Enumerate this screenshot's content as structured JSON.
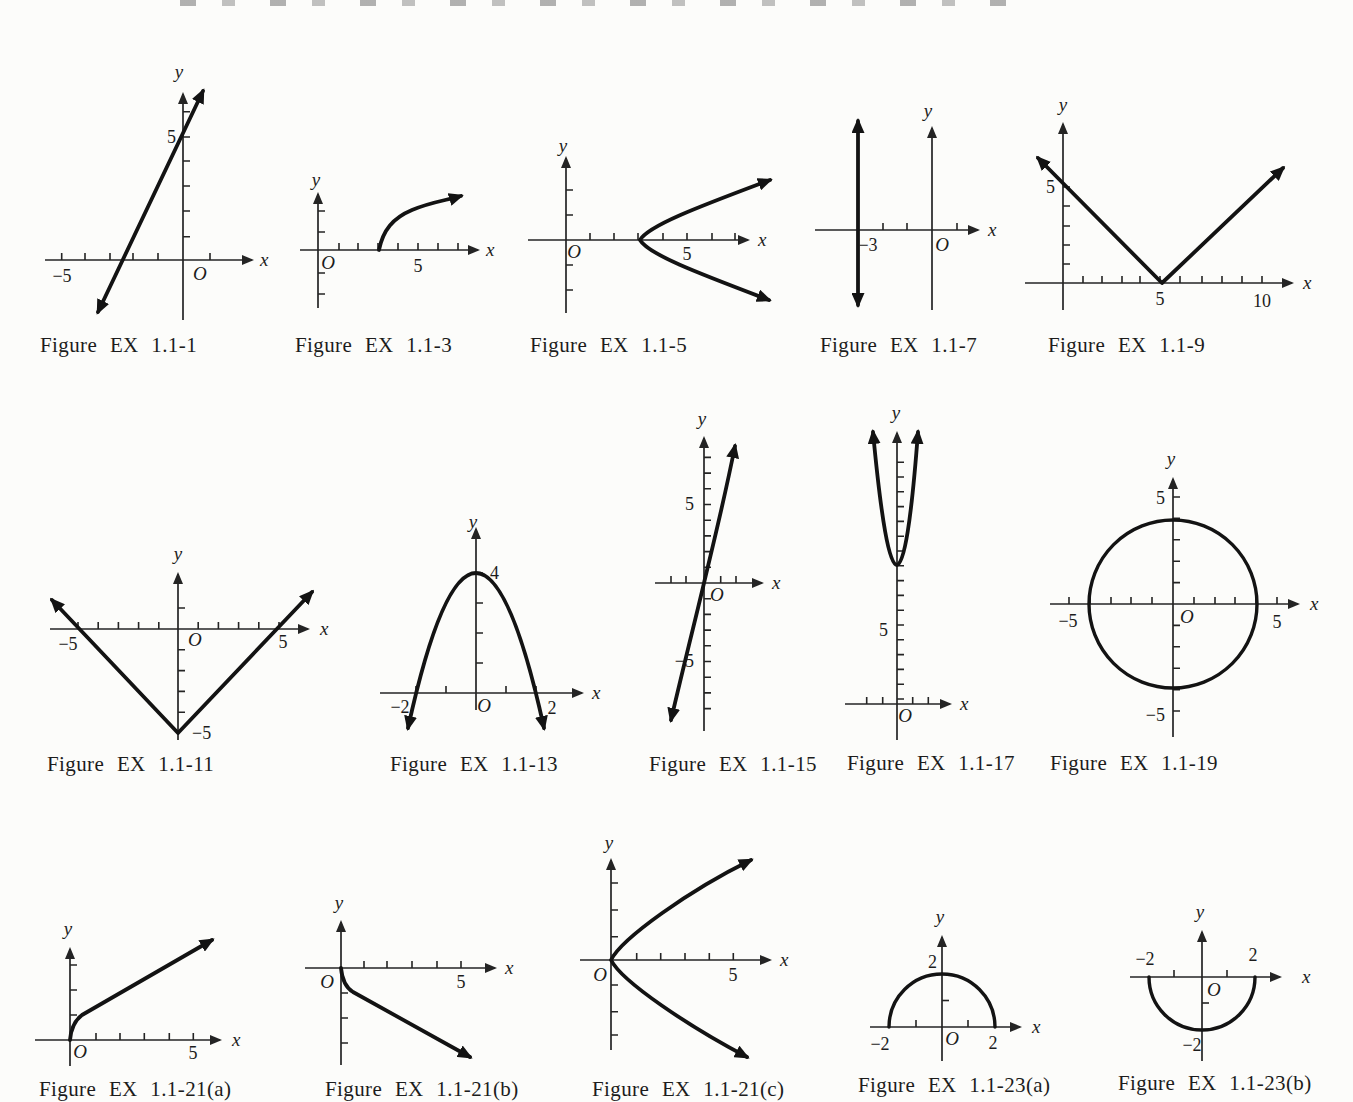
{
  "page": {
    "background": "#fcfcfa",
    "ink": "#1c1c1c"
  },
  "figures": [
    {
      "caption": "Figure EX 1.1-1",
      "plot": {
        "type": "line",
        "detail": "straight line, slope 2, through (0, 5) and (−2.5, 0), arrows both ends"
      },
      "labels": {
        "y": "y",
        "x": "x",
        "origin": "O",
        "x_neg5": "−5",
        "y_5": "5"
      }
    },
    {
      "caption": "Figure EX 1.1-3",
      "plot": {
        "type": "curve",
        "detail": "square-root style curve starting at (3, 0) rising to upper right, arrow at end"
      },
      "labels": {
        "y": "y",
        "x": "x",
        "origin": "O",
        "x_5": "5"
      }
    },
    {
      "caption": "Figure EX 1.1-5",
      "plot": {
        "type": "sideways-parabola",
        "detail": "parabola opening right, vertex (3, 0), arrows on both branches"
      },
      "labels": {
        "y": "y",
        "x": "x",
        "origin": "O",
        "x_5": "5"
      }
    },
    {
      "caption": "Figure EX 1.1-7",
      "plot": {
        "type": "vertical-line",
        "detail": "vertical line x = −3, arrows both ends"
      },
      "labels": {
        "y": "y",
        "x": "x",
        "origin": "O",
        "x_neg3": "−3"
      }
    },
    {
      "caption": "Figure EX 1.1-9",
      "plot": {
        "type": "absolute-value",
        "detail": "V shape, vertex (5, 0), y-intercept 5, arrows both ends"
      },
      "labels": {
        "y": "y",
        "x": "x",
        "y_5": "5",
        "x_5": "5",
        "x_10": "10"
      }
    },
    {
      "caption": "Figure EX 1.1-11",
      "plot": {
        "type": "absolute-value",
        "detail": "valley V, vertex (0, −5), x-intercepts −5 and 5, arrows both ends"
      },
      "labels": {
        "y": "y",
        "x": "x",
        "origin": "O",
        "x_neg5": "−5",
        "x_5": "5",
        "vertex": "−5"
      }
    },
    {
      "caption": "Figure EX 1.1-13",
      "plot": {
        "type": "parabola",
        "detail": "downward parabola, vertex (0, 4), x-intercepts −2 and 2, arrows both ends"
      },
      "labels": {
        "y": "y",
        "x": "x",
        "origin": "O",
        "y_4": "4",
        "x_neg2": "−2",
        "x_2": "2"
      }
    },
    {
      "caption": "Figure EX 1.1-15",
      "plot": {
        "type": "cubic",
        "detail": "S-shaped cubic through origin, arrows up-right and down-left"
      },
      "labels": {
        "y": "y",
        "x": "x",
        "origin": "O",
        "y_5": "5",
        "y_neg5": "−5"
      }
    },
    {
      "caption": "Figure EX 1.1-17",
      "plot": {
        "type": "parabola",
        "detail": "narrow upward parabola, vertex on y-axis near y = 9, arrows on both branches"
      },
      "labels": {
        "y": "y",
        "x": "x",
        "origin": "O",
        "y_5": "5"
      }
    },
    {
      "caption": "Figure EX 1.1-19",
      "plot": {
        "type": "circle",
        "detail": "circle centered at origin, radius 4"
      },
      "labels": {
        "y": "y",
        "x": "x",
        "origin": "O",
        "x_neg5": "−5",
        "x_5": "5",
        "y_5": "5",
        "y_neg5": "−5"
      }
    },
    {
      "caption": "Figure EX 1.1-21(a)",
      "plot": {
        "type": "curve",
        "detail": "curve from origin, steep then nearly straight to upper right, arrow at end"
      },
      "labels": {
        "y": "y",
        "x": "x",
        "origin": "O",
        "x_5": "5"
      }
    },
    {
      "caption": "Figure EX 1.1-21(b)",
      "plot": {
        "type": "curve",
        "detail": "curve from origin, steep then nearly straight to lower right, arrow at end"
      },
      "labels": {
        "y": "y",
        "x": "x",
        "origin": "O",
        "x_5": "5"
      }
    },
    {
      "caption": "Figure EX 1.1-21(c)",
      "plot": {
        "type": "sideways-parabola",
        "detail": "parabola opening right, vertex at origin, arrows on both branches"
      },
      "labels": {
        "y": "y",
        "x": "x",
        "origin": "O",
        "x_5": "5"
      }
    },
    {
      "caption": "Figure EX 1.1-23(a)",
      "plot": {
        "type": "semicircle",
        "detail": "upper semicircle, radius 2, centered at origin"
      },
      "labels": {
        "y": "y",
        "x": "x",
        "origin": "O",
        "x_neg2": "−2",
        "x_2": "2",
        "y_2": "2"
      }
    },
    {
      "caption": "Figure EX 1.1-23(b)",
      "plot": {
        "type": "semicircle",
        "detail": "lower semicircle, radius 2, centered at origin"
      },
      "labels": {
        "y": "y",
        "x": "x",
        "origin": "O",
        "x_neg2": "−2",
        "x_2": "2",
        "y_neg2": "−2"
      }
    }
  ]
}
